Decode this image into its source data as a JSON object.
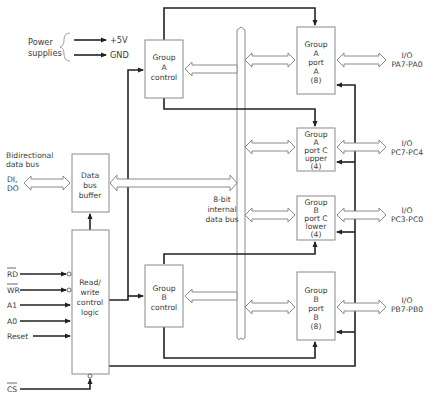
{
  "diagram": {
    "title_hidden": "8255 programmable peripheral interface block diagram",
    "power": {
      "label_line1": "Power",
      "label_line2": "supplies",
      "vcc": "+5V",
      "gnd": "GND"
    },
    "data_bus": {
      "label_line1": "Bidirectional",
      "label_line2": "data bus",
      "pins_line1": "DI,",
      "pins_line2": "DO"
    },
    "internal_bus": {
      "line1": "8-bit",
      "line2": "internal",
      "line3": "data bus"
    },
    "blocks": {
      "data_bus_buffer": [
        "Data",
        "bus",
        "buffer"
      ],
      "rw_logic": [
        "Read/",
        "write",
        "control",
        "logic"
      ],
      "group_a_control": [
        "Group",
        "A",
        "control"
      ],
      "group_b_control": [
        "Group",
        "B",
        "control"
      ],
      "port_a": [
        "Group",
        "A",
        "port",
        "A",
        "(8)"
      ],
      "port_c_upper": [
        "Group",
        "A",
        "port C",
        "upper",
        "(4)"
      ],
      "port_c_lower": [
        "Group",
        "B",
        "port C",
        "lower",
        "(4)"
      ],
      "port_b": [
        "Group",
        "B",
        "port",
        "B",
        "(8)"
      ]
    },
    "control_inputs": [
      "RD",
      "WR",
      "A1",
      "A0",
      "Reset"
    ],
    "chip_select": "CS",
    "io_ports": [
      {
        "line1": "I/O",
        "line2": "PA7-PA0"
      },
      {
        "line1": "I/O",
        "line2": "PC7-PC4"
      },
      {
        "line1": "I/O",
        "line2": "PC3-PC0"
      },
      {
        "line1": "I/O",
        "line2": "PB7-PB0"
      }
    ],
    "colors": {
      "wire": "#222222",
      "box_stroke": "#8a8a8a",
      "text": "#3a3a3a"
    }
  }
}
